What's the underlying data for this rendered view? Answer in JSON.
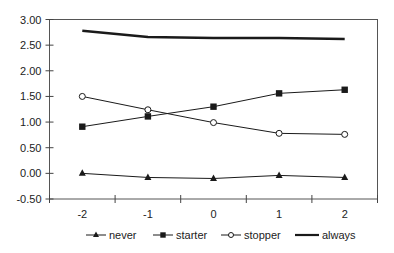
{
  "chart_data": {
    "type": "line",
    "title": "",
    "xlabel": "",
    "ylabel": "",
    "x": [
      -2,
      -1,
      0,
      1,
      2
    ],
    "x_tick_labels": [
      "-2",
      "-1",
      "0",
      "1",
      "2"
    ],
    "ylim": [
      -0.5,
      3.0
    ],
    "y_ticks": [
      3.0,
      2.5,
      2.0,
      1.5,
      1.0,
      0.5,
      0.0,
      -0.5
    ],
    "y_tick_labels": [
      "3.00",
      "2.50",
      "2.00",
      "1.50",
      "1.00",
      "0.50",
      "0.00",
      "-0.50"
    ],
    "grid": false,
    "legend_position": "bottom",
    "series": [
      {
        "name": "never",
        "marker": "triangle-filled",
        "line_weight": "thin",
        "values": [
          0.0,
          -0.08,
          -0.1,
          -0.04,
          -0.08
        ]
      },
      {
        "name": "starter",
        "marker": "square-filled",
        "line_weight": "thin",
        "values": [
          0.91,
          1.11,
          1.3,
          1.56,
          1.63
        ]
      },
      {
        "name": "stopper",
        "marker": "circle-open",
        "line_weight": "thin",
        "values": [
          1.5,
          1.24,
          0.99,
          0.78,
          0.76
        ]
      },
      {
        "name": "always",
        "marker": "none",
        "line_weight": "thick",
        "values": [
          2.78,
          2.66,
          2.64,
          2.64,
          2.62
        ]
      }
    ]
  },
  "colors": {
    "line": "#1a1a1a",
    "axis": "#444444",
    "background": "#ffffff"
  }
}
